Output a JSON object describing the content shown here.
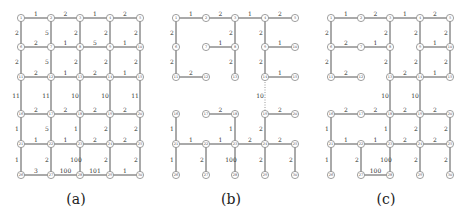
{
  "grid": {
    "cols": [
      21,
      51,
      80,
      110,
      140
    ],
    "rows": [
      18,
      47,
      77,
      114,
      144,
      175
    ],
    "panel_offsets": [
      0,
      155,
      310
    ]
  },
  "panels": [
    {
      "caption": "(a)",
      "edges": [
        [
          1,
          2,
          "1"
        ],
        [
          2,
          3,
          "2"
        ],
        [
          3,
          4,
          "1"
        ],
        [
          4,
          5,
          "2"
        ],
        [
          1,
          6,
          "2"
        ],
        [
          2,
          7,
          "5"
        ],
        [
          3,
          8,
          "2"
        ],
        [
          4,
          9,
          "2"
        ],
        [
          5,
          10,
          "2"
        ],
        [
          6,
          7,
          "2"
        ],
        [
          7,
          8,
          "1"
        ],
        [
          8,
          9,
          "5"
        ],
        [
          9,
          10,
          "1"
        ],
        [
          6,
          11,
          "2"
        ],
        [
          7,
          12,
          "5"
        ],
        [
          8,
          13,
          "2"
        ],
        [
          9,
          14,
          "2"
        ],
        [
          10,
          15,
          "2"
        ],
        [
          11,
          12,
          "2"
        ],
        [
          12,
          13,
          "1"
        ],
        [
          13,
          14,
          "2"
        ],
        [
          14,
          15,
          "1"
        ],
        [
          11,
          16,
          "11"
        ],
        [
          12,
          17,
          "11"
        ],
        [
          13,
          18,
          "10"
        ],
        [
          14,
          19,
          "10"
        ],
        [
          15,
          20,
          "11"
        ],
        [
          16,
          17,
          "2"
        ],
        [
          17,
          18,
          "2"
        ],
        [
          18,
          19,
          "2"
        ],
        [
          19,
          20,
          "2"
        ],
        [
          16,
          21,
          "1"
        ],
        [
          17,
          22,
          "5"
        ],
        [
          18,
          23,
          "1"
        ],
        [
          19,
          24,
          "2"
        ],
        [
          20,
          25,
          "2"
        ],
        [
          21,
          22,
          "1"
        ],
        [
          22,
          23,
          "1"
        ],
        [
          23,
          24,
          "2"
        ],
        [
          24,
          25,
          "2"
        ],
        [
          21,
          26,
          "1"
        ],
        [
          22,
          27,
          "2"
        ],
        [
          23,
          28,
          "100"
        ],
        [
          24,
          29,
          "2"
        ],
        [
          25,
          30,
          "2"
        ],
        [
          26,
          27,
          "3"
        ],
        [
          27,
          28,
          "100"
        ],
        [
          28,
          29,
          "101"
        ],
        [
          29,
          30,
          "1"
        ]
      ],
      "dotted": []
    },
    {
      "caption": "(b)",
      "edges": [
        [
          1,
          2,
          "1"
        ],
        [
          2,
          3,
          "2"
        ],
        [
          3,
          4,
          "1"
        ],
        [
          4,
          5,
          "2"
        ],
        [
          1,
          6,
          "2"
        ],
        [
          3,
          8,
          "2"
        ],
        [
          4,
          9,
          "2"
        ],
        [
          7,
          8,
          "1"
        ],
        [
          9,
          10,
          "1"
        ],
        [
          6,
          11,
          "2"
        ],
        [
          8,
          13,
          "2"
        ],
        [
          9,
          14,
          "2"
        ],
        [
          11,
          12,
          "2"
        ],
        [
          14,
          15,
          "1"
        ],
        [
          17,
          18,
          "2"
        ],
        [
          19,
          20,
          "2"
        ],
        [
          16,
          21,
          "1"
        ],
        [
          18,
          23,
          "1"
        ],
        [
          19,
          24,
          "2"
        ],
        [
          21,
          22,
          "1"
        ],
        [
          22,
          23,
          "1"
        ],
        [
          23,
          24,
          "2"
        ],
        [
          24,
          25,
          "2"
        ],
        [
          21,
          26,
          "1"
        ],
        [
          22,
          27,
          "2"
        ],
        [
          23,
          28,
          "100"
        ],
        [
          24,
          29,
          "2"
        ],
        [
          25,
          30,
          "2"
        ]
      ],
      "dotted": [
        [
          14,
          19,
          "10"
        ]
      ]
    },
    {
      "caption": "(c)",
      "edges": [
        [
          1,
          2,
          "1"
        ],
        [
          2,
          3,
          "2"
        ],
        [
          3,
          4,
          "1"
        ],
        [
          4,
          5,
          "2"
        ],
        [
          1,
          6,
          "2"
        ],
        [
          3,
          8,
          "2"
        ],
        [
          4,
          9,
          "2"
        ],
        [
          5,
          10,
          "2"
        ],
        [
          6,
          7,
          "2"
        ],
        [
          7,
          8,
          "1"
        ],
        [
          9,
          10,
          "1"
        ],
        [
          6,
          11,
          "2"
        ],
        [
          8,
          13,
          "2"
        ],
        [
          9,
          14,
          "2"
        ],
        [
          10,
          15,
          "2"
        ],
        [
          11,
          12,
          "2"
        ],
        [
          13,
          14,
          "2"
        ],
        [
          14,
          15,
          "1"
        ],
        [
          13,
          18,
          "10"
        ],
        [
          14,
          19,
          "10"
        ],
        [
          16,
          17,
          "2"
        ],
        [
          17,
          18,
          "2"
        ],
        [
          18,
          19,
          "2"
        ],
        [
          19,
          20,
          "2"
        ],
        [
          16,
          21,
          "1"
        ],
        [
          18,
          23,
          "1"
        ],
        [
          19,
          24,
          "2"
        ],
        [
          20,
          25,
          "2"
        ],
        [
          21,
          22,
          "1"
        ],
        [
          22,
          23,
          "1"
        ],
        [
          23,
          24,
          "2"
        ],
        [
          24,
          25,
          "2"
        ],
        [
          21,
          26,
          "1"
        ],
        [
          22,
          27,
          "2"
        ],
        [
          23,
          28,
          "100"
        ],
        [
          24,
          29,
          "2"
        ],
        [
          25,
          30,
          "2"
        ],
        [
          27,
          28,
          "100"
        ]
      ],
      "dotted": []
    }
  ]
}
